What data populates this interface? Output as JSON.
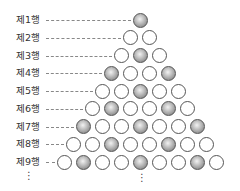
{
  "diagram": {
    "rows": [
      {
        "label": "제1행",
        "pattern": [
          1
        ]
      },
      {
        "label": "제2행",
        "pattern": [
          0,
          0
        ]
      },
      {
        "label": "제3행",
        "pattern": [
          0,
          1,
          0
        ]
      },
      {
        "label": "제4행",
        "pattern": [
          1,
          0,
          0,
          1
        ]
      },
      {
        "label": "제5행",
        "pattern": [
          0,
          0,
          1,
          0,
          0
        ]
      },
      {
        "label": "제6행",
        "pattern": [
          0,
          1,
          0,
          0,
          1,
          0
        ]
      },
      {
        "label": "제7행",
        "pattern": [
          1,
          0,
          0,
          1,
          0,
          0,
          1
        ]
      },
      {
        "label": "제8행",
        "pattern": [
          0,
          0,
          1,
          0,
          0,
          1,
          0,
          0
        ]
      },
      {
        "label": "제9행",
        "pattern": [
          0,
          1,
          0,
          0,
          1,
          0,
          0,
          1,
          0
        ]
      }
    ],
    "legend": {
      "shaded": "shaded ball",
      "open": "open ball"
    },
    "continuation": "⋮",
    "colors": {
      "outline": "#555555",
      "shaded_dark": "#6f6f6f",
      "shaded_light": "#f2f2f2",
      "leader": "#888888"
    }
  }
}
